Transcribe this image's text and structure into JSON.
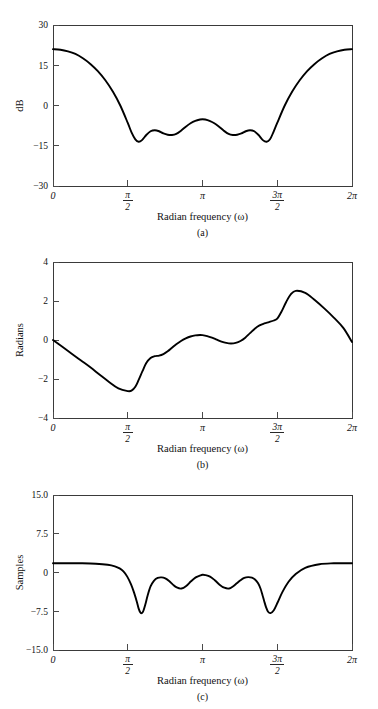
{
  "figure": {
    "background": "#ffffff",
    "curve_color": "#000000",
    "axis_color": "#3a3a3a"
  },
  "panels": [
    {
      "id": "a",
      "caption": "(a)",
      "ylabel": "dB",
      "xlabel": "Radian frequency (ω)",
      "ytick_labels": [
        "30",
        "15",
        "0",
        "−15",
        "−30"
      ],
      "xtick_labels": [
        "0",
        "π/2",
        "π",
        "3π/2",
        "2π"
      ]
    },
    {
      "id": "b",
      "caption": "(b)",
      "ylabel": "Radians",
      "xlabel": "Radian frequency (ω)",
      "ytick_labels": [
        "4",
        "2",
        "0",
        "−2",
        "−4"
      ],
      "xtick_labels": [
        "0",
        "π/2",
        "π",
        "3π/2",
        "2π"
      ]
    },
    {
      "id": "c",
      "caption": "(c)",
      "ylabel": "Samples",
      "xlabel": "Radian frequency (ω)",
      "ytick_labels": [
        "15.0",
        "7.5",
        "0",
        "−7.5",
        "−15.0"
      ],
      "xtick_labels": [
        "0",
        "π/2",
        "π",
        "3π/2",
        "2π"
      ]
    }
  ],
  "chart_data": [
    {
      "type": "line",
      "id": "a",
      "title": "",
      "xlabel": "Radian frequency (ω)",
      "ylabel": "dB",
      "xlim": [
        0,
        6.283185
      ],
      "ylim": [
        -30,
        30
      ],
      "xticks": [
        0,
        1.570796,
        3.141593,
        4.712389,
        6.283185
      ],
      "xtick_labels": [
        "0",
        "π/2",
        "π",
        "3π/2",
        "2π"
      ],
      "yticks": [
        -30,
        -15,
        0,
        15,
        30
      ],
      "ytick_labels": [
        "−30",
        "−15",
        "0",
        "15",
        "30"
      ],
      "grid": false,
      "legend": null,
      "x": [
        0.0,
        0.157,
        0.314,
        0.471,
        0.628,
        0.785,
        0.942,
        1.1,
        1.257,
        1.414,
        1.571,
        1.65,
        1.73,
        1.8,
        1.87,
        1.96,
        2.05,
        2.14,
        2.23,
        2.32,
        2.41,
        2.5,
        2.59,
        2.69,
        2.79,
        2.89,
        2.99,
        3.09,
        3.142,
        3.2,
        3.29,
        3.39,
        3.49,
        3.59,
        3.69,
        3.78,
        3.87,
        3.96,
        4.05,
        4.14,
        4.23,
        4.32,
        4.41,
        4.49,
        4.56,
        4.63,
        4.712,
        4.87,
        5.027,
        5.184,
        5.341,
        5.498,
        5.655,
        5.812,
        5.969,
        6.126,
        6.283
      ],
      "y": [
        21.0,
        20.8,
        20.2,
        19.2,
        17.6,
        15.5,
        12.8,
        9.4,
        5.2,
        0.0,
        -6.5,
        -10.0,
        -12.6,
        -13.5,
        -12.9,
        -11.0,
        -9.6,
        -9.2,
        -9.6,
        -10.4,
        -10.9,
        -11.0,
        -10.6,
        -9.4,
        -7.9,
        -6.6,
        -5.7,
        -5.2,
        -5.1,
        -5.2,
        -5.7,
        -6.6,
        -7.9,
        -9.4,
        -10.6,
        -11.0,
        -10.9,
        -10.4,
        -9.6,
        -9.2,
        -9.6,
        -11.0,
        -12.9,
        -13.5,
        -12.6,
        -10.0,
        -6.5,
        0.0,
        5.2,
        9.4,
        12.8,
        15.5,
        17.6,
        19.2,
        20.2,
        20.8,
        21.0
      ],
      "description": "Log magnitude (dB) of a bandstop filter: passband near 21 dB at ω=0 and ω=2π, deep equiripple stopband near −13 dB between π/2 and 3π/2"
    },
    {
      "type": "line",
      "id": "b",
      "title": "",
      "xlabel": "Radian frequency (ω)",
      "ylabel": "Radians",
      "xlim": [
        0,
        6.283185
      ],
      "ylim": [
        -4,
        4
      ],
      "xticks": [
        0,
        1.570796,
        3.141593,
        4.712389,
        6.283185
      ],
      "xtick_labels": [
        "0",
        "π/2",
        "π",
        "3π/2",
        "2π"
      ],
      "yticks": [
        -4,
        -2,
        0,
        2,
        4
      ],
      "ytick_labels": [
        "−4",
        "−2",
        "0",
        "2",
        "4"
      ],
      "grid": false,
      "legend": null,
      "x": [
        0.0,
        0.196,
        0.393,
        0.589,
        0.785,
        0.982,
        1.178,
        1.374,
        1.571,
        1.65,
        1.73,
        1.8,
        1.88,
        1.96,
        2.05,
        2.14,
        2.23,
        2.32,
        2.41,
        2.5,
        2.59,
        2.69,
        2.79,
        2.89,
        2.99,
        3.09,
        3.142,
        3.24,
        3.34,
        3.44,
        3.54,
        3.64,
        3.74,
        3.84,
        3.94,
        4.04,
        4.14,
        4.24,
        4.34,
        4.44,
        4.54,
        4.64,
        4.712,
        4.8,
        4.9,
        5.0,
        5.1,
        5.3,
        5.5,
        5.7,
        5.9,
        6.1,
        6.283
      ],
      "y": [
        0.0,
        -0.35,
        -0.7,
        -1.05,
        -1.4,
        -1.78,
        -2.15,
        -2.48,
        -2.62,
        -2.6,
        -2.4,
        -2.05,
        -1.6,
        -1.18,
        -0.92,
        -0.83,
        -0.8,
        -0.72,
        -0.58,
        -0.4,
        -0.22,
        -0.05,
        0.08,
        0.18,
        0.24,
        0.26,
        0.25,
        0.2,
        0.12,
        0.02,
        -0.08,
        -0.15,
        -0.18,
        -0.15,
        -0.05,
        0.12,
        0.35,
        0.58,
        0.75,
        0.85,
        0.92,
        1.0,
        1.1,
        1.45,
        1.95,
        2.35,
        2.52,
        2.42,
        2.05,
        1.62,
        1.15,
        0.62,
        -0.1
      ],
      "description": "Phase response in radians, decreasing linearly to about −2.6 near π/2, rising through small ripples to a peak of about 2.5 near 3π/2, then falling to 0 at 2π"
    },
    {
      "type": "line",
      "id": "c",
      "title": "",
      "xlabel": "Radian frequency (ω)",
      "ylabel": "Samples",
      "xlim": [
        0,
        6.283185
      ],
      "ylim": [
        -15.0,
        15.0
      ],
      "xticks": [
        0,
        1.570796,
        3.141593,
        4.712389,
        6.283185
      ],
      "xtick_labels": [
        "0",
        "π/2",
        "π",
        "3π/2",
        "2π"
      ],
      "yticks": [
        -15.0,
        -7.5,
        0,
        7.5,
        15.0
      ],
      "ytick_labels": [
        "−15.0",
        "−7.5",
        "0",
        "7.5",
        "15.0"
      ],
      "grid": false,
      "legend": null,
      "x": [
        0.0,
        0.3,
        0.6,
        0.9,
        1.15,
        1.3,
        1.4,
        1.48,
        1.56,
        1.64,
        1.7,
        1.76,
        1.8,
        1.84,
        1.87,
        1.9,
        1.94,
        1.99,
        2.05,
        2.12,
        2.2,
        2.28,
        2.36,
        2.44,
        2.52,
        2.6,
        2.7,
        2.8,
        2.9,
        3.0,
        3.1,
        3.142,
        3.2,
        3.3,
        3.4,
        3.5,
        3.6,
        3.7,
        3.78,
        3.86,
        3.94,
        4.02,
        4.1,
        4.18,
        4.25,
        4.31,
        4.36,
        4.4,
        4.44,
        4.48,
        4.52,
        4.57,
        4.64,
        4.72,
        4.82,
        4.95,
        5.1,
        5.3,
        5.6,
        5.9,
        6.1,
        6.283
      ],
      "y": [
        1.8,
        1.8,
        1.78,
        1.7,
        1.5,
        1.2,
        0.8,
        0.2,
        -0.8,
        -2.3,
        -3.8,
        -5.6,
        -7.0,
        -7.8,
        -7.85,
        -7.4,
        -6.2,
        -4.4,
        -2.7,
        -1.6,
        -1.05,
        -0.95,
        -1.15,
        -1.65,
        -2.35,
        -2.9,
        -3.1,
        -2.6,
        -1.7,
        -0.95,
        -0.55,
        -0.45,
        -0.5,
        -0.8,
        -1.5,
        -2.35,
        -2.95,
        -3.1,
        -2.7,
        -2.1,
        -1.5,
        -1.05,
        -0.9,
        -1.0,
        -1.4,
        -2.1,
        -3.1,
        -4.3,
        -5.6,
        -6.8,
        -7.6,
        -7.85,
        -7.3,
        -5.8,
        -3.8,
        -1.8,
        -0.3,
        0.9,
        1.6,
        1.78,
        1.8,
        1.8
      ],
      "description": "Group delay in samples: flat near 1.8 in the passbands with two deep narrow nulls reaching about −7.8 samples near ω≈1.87 and ω≈4.57, plus shallower ripples between"
    }
  ]
}
